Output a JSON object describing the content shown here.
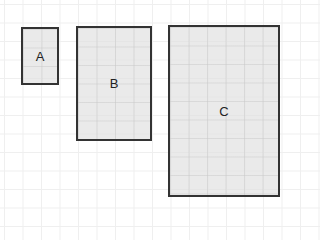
{
  "diagram": {
    "boxes": [
      {
        "id": "A",
        "label": "A",
        "x": 21,
        "y": 27,
        "w": 38,
        "h": 58
      },
      {
        "id": "B",
        "label": "B",
        "x": 76,
        "y": 26,
        "w": 76,
        "h": 115
      },
      {
        "id": "C",
        "label": "C",
        "x": 168,
        "y": 25,
        "w": 112,
        "h": 172
      }
    ],
    "grid_spacing": 18.5,
    "colors": {
      "border": "#333333",
      "fill": "#e1e1e1",
      "grid": "#efefef"
    }
  }
}
